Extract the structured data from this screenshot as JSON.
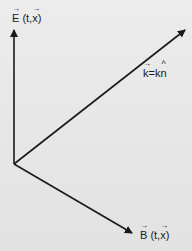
{
  "diagram": {
    "type": "vector-diagram",
    "colors": {
      "background": "#e6e6e6",
      "line": "#1a1a1a"
    },
    "origin": [
      14,
      164
    ],
    "vectors": [
      {
        "name": "E",
        "tip": [
          14,
          28
        ]
      },
      {
        "name": "k",
        "tip": [
          187,
          29
        ]
      },
      {
        "name": "B",
        "tip": [
          134,
          234
        ]
      }
    ],
    "labels": {
      "e_field": {
        "symbol": "E",
        "args": " (t,",
        "x": "x",
        "close": ")"
      },
      "wave_vector": {
        "lhs": "k",
        "eq": "=k",
        "unit": "n"
      },
      "b_field": {
        "symbol": "B",
        "args": " (t,",
        "x": "x",
        "close": ")"
      }
    }
  }
}
